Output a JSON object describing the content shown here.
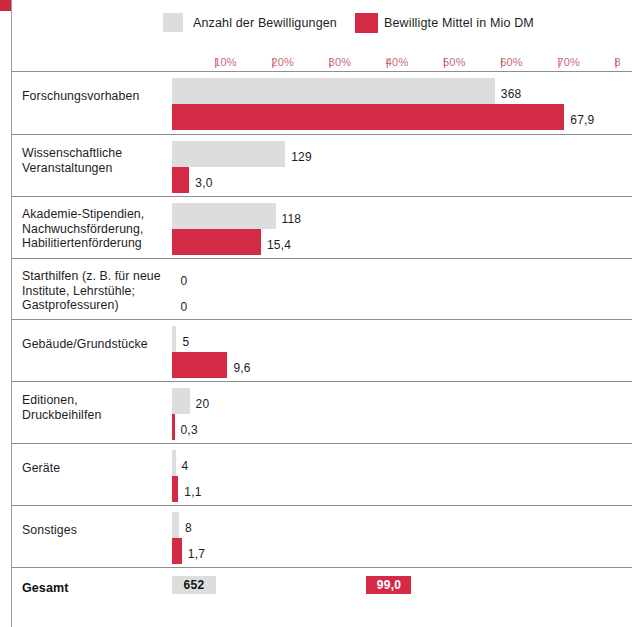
{
  "legend": {
    "gray_label": "Anzahl der Bewilligungen",
    "red_label": "Bewilligte Mittel in Mio DM",
    "gray_color": "#dcdedd",
    "red_color": "#d32b46"
  },
  "axis": {
    "ticks": [
      "10%",
      "20%",
      "30%",
      "40%",
      "50%",
      "60%",
      "70%",
      "8"
    ],
    "tick_mark": "|",
    "color": "#c96a78"
  },
  "total": {
    "label": "Gesamt",
    "count": "652",
    "funds": "99,0"
  },
  "chart_data": {
    "type": "bar",
    "title": "",
    "xlabel": "",
    "ylabel": "",
    "orientation": "horizontal",
    "grid": false,
    "legend_position": "top",
    "xlim": [
      0,
      80
    ],
    "xticks": [
      10,
      20,
      30,
      40,
      50,
      60,
      70,
      80
    ],
    "xtick_labels": [
      "10%",
      "20%",
      "30%",
      "40%",
      "50%",
      "60%",
      "70%",
      "80%"
    ],
    "categories": [
      "Forschungsvorhaben",
      "Wissenschaftliche\nVeranstaltungen",
      "Akademie-Stipendien,\nNachwuchsförderung,\nHabilitiertenförderung",
      "Starthilfen (z. B. für neue\nInstitute, Lehrstühle;\nGastprofessuren)",
      "Gebäude/Grundstücke",
      "Editionen,\nDruckbeihilfen",
      "Geräte",
      "Sonstiges"
    ],
    "series": [
      {
        "name": "Anzahl der Bewilligungen",
        "color": "#dcdedd",
        "total": 652,
        "values": [
          368,
          129,
          118,
          0,
          5,
          20,
          4,
          8
        ],
        "labels": [
          "368",
          "129",
          "118",
          "0",
          "5",
          "20",
          "4",
          "8"
        ]
      },
      {
        "name": "Bewilligte Mittel in Mio DM",
        "color": "#d32b46",
        "total": 99.0,
        "values": [
          67.9,
          3.0,
          15.4,
          0,
          9.6,
          0.3,
          1.1,
          1.7
        ],
        "labels": [
          "67,9",
          "3,0",
          "15,4",
          "0",
          "9,6",
          "0,3",
          "1,1",
          "1,7"
        ]
      }
    ]
  }
}
